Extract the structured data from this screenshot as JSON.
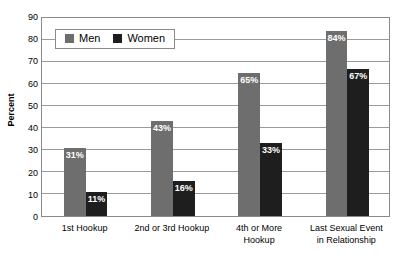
{
  "chart_data": {
    "type": "bar",
    "title": "",
    "xlabel": "",
    "ylabel": "Percent",
    "ylim": [
      0,
      90
    ],
    "ytick_step": 10,
    "yticks": [
      90,
      80,
      70,
      60,
      50,
      40,
      30,
      20,
      10,
      0
    ],
    "grid": true,
    "legend_position": "top-left-inside",
    "categories": [
      "1st Hookup",
      "2nd or 3rd Hookup",
      "4th or More Hookup",
      "Last Sexual Event in Relationship"
    ],
    "category_lines": [
      [
        "1st Hookup"
      ],
      [
        "2nd or 3rd Hookup"
      ],
      [
        "4th or More",
        "Hookup"
      ],
      [
        "Last Sexual Event",
        "in Relationship"
      ]
    ],
    "series": [
      {
        "name": "Men",
        "color": "#6e6e6e",
        "values": [
          31,
          43,
          65,
          84
        ],
        "labels": [
          "31%",
          "43%",
          "65%",
          "84%"
        ]
      },
      {
        "name": "Women",
        "color": "#1e1e1e",
        "values": [
          11,
          16,
          33,
          67
        ],
        "labels": [
          "11%",
          "16%",
          "33%",
          "67%"
        ]
      }
    ]
  },
  "legend": {
    "items": [
      {
        "label": "Men",
        "swatch": "men-swatch"
      },
      {
        "label": "Women",
        "swatch": "women-swatch"
      }
    ]
  },
  "axis": {
    "y_title": "Percent"
  },
  "colors": {
    "men": "#6e6e6e",
    "women": "#1e1e1e",
    "grid": "#9a9a9a",
    "frame": "#8a8a8a",
    "background": "#ffffff",
    "label_text": "#ffffff"
  }
}
